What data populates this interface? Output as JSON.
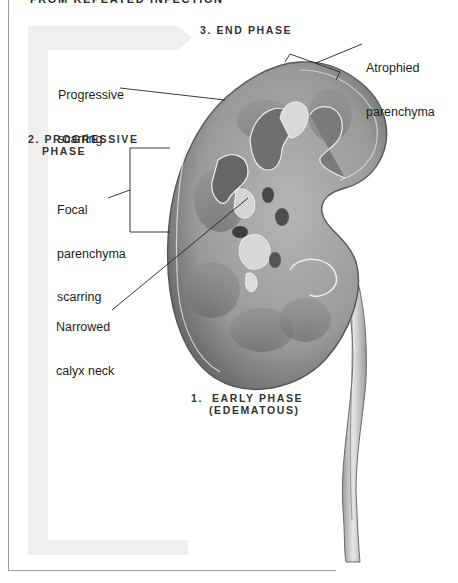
{
  "figure": {
    "heading_partial": "FROM REPEATED INFECTION",
    "phases": [
      {
        "id": "end",
        "text": "3. END PHASE"
      },
      {
        "id": "progressive",
        "line1": "2. PROGRESSIVE",
        "line2": "PHASE"
      },
      {
        "id": "early",
        "line1": "1.  EARLY PHASE",
        "line2": "(EDEMATOUS)"
      }
    ],
    "labels": {
      "atrophied_parenchyma": {
        "line1": "Atrophied",
        "line2": "parenchyma"
      },
      "progressive_scarring": {
        "line1": "Progressive",
        "line2": "scarring"
      },
      "focal_parenchyma_scarring": {
        "line1": "Focal",
        "line2": "parenchyma",
        "line3": "scarring"
      },
      "narrowed_calyx_neck": {
        "line1": "Narrowed",
        "line2": "calyx neck"
      }
    },
    "icons": {
      "progression_arrow": "faded-gray-arrow-icon",
      "kidney": "kidney-cross-section-illustration",
      "ureter": "ureter-illustration"
    },
    "colors": {
      "arrow_fill": "#efefef",
      "kidney_cortex": "#8c8c8c",
      "kidney_medulla": "#6e6e6e",
      "calyx_fill": "#d8d8d8",
      "text": "#1e1e1e",
      "phase_text": "#333333"
    }
  }
}
